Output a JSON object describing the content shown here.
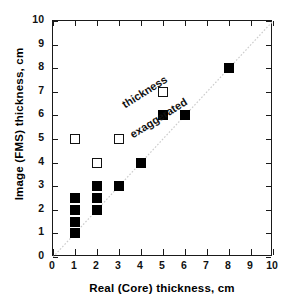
{
  "chart_data": {
    "type": "scatter",
    "title": "",
    "xlabel": "Real (Core) thickness, cm",
    "ylabel": "Image (FMS) thickness, cm",
    "xlim": [
      0,
      10
    ],
    "ylim": [
      0,
      10
    ],
    "xticks": [
      0,
      1,
      2,
      3,
      4,
      5,
      6,
      7,
      8,
      9,
      10
    ],
    "yticks": [
      0,
      1,
      2,
      3,
      4,
      5,
      6,
      7,
      8,
      9,
      10
    ],
    "xticklabels": [
      "0",
      "1",
      "2",
      "3",
      "4",
      "5",
      "6",
      "7",
      "8",
      "9",
      "10"
    ],
    "yticklabels": [
      "0",
      "1",
      "2",
      "3",
      "4",
      "5",
      "6",
      "7",
      "8",
      "9",
      "10"
    ],
    "grid": false,
    "legend": null,
    "reference_line": {
      "name": "one-to-one-line",
      "from": [
        0,
        0
      ],
      "to": [
        10,
        10
      ],
      "style": "dotted",
      "color": "#cccccc"
    },
    "annotations": [
      {
        "text": "thickness",
        "x": 1.0,
        "y": 8.1,
        "rotation": -32
      },
      {
        "text": "exaggerated",
        "x": 1.4,
        "y": 6.9,
        "rotation": -32
      }
    ],
    "series": [
      {
        "name": "filled-squares",
        "marker": "filled-square",
        "color": "#000000",
        "points": [
          [
            1,
            2.5
          ],
          [
            1,
            2.0
          ],
          [
            1,
            1.5
          ],
          [
            1,
            1.0
          ],
          [
            2,
            3.0
          ],
          [
            2,
            2.5
          ],
          [
            2,
            2.0
          ],
          [
            3,
            3.0
          ],
          [
            4,
            4.0
          ],
          [
            5,
            6.0
          ],
          [
            6,
            6.0
          ],
          [
            8,
            8.0
          ]
        ]
      },
      {
        "name": "open-squares",
        "marker": "open-square",
        "color": "#ffffff",
        "edgecolor": "#111111",
        "points": [
          [
            1,
            5.0
          ],
          [
            2,
            4.0
          ],
          [
            3,
            5.0
          ],
          [
            5,
            7.0
          ]
        ]
      }
    ]
  },
  "colors": {
    "axis": "#1a1a1a",
    "marker_fill": "#000000",
    "marker_edge": "#111111",
    "reference_line": "#cccccc",
    "background": "#ffffff"
  }
}
